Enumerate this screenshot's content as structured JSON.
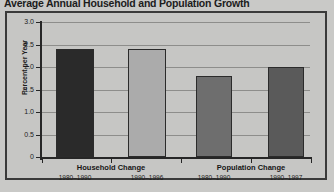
{
  "chart_data": {
    "type": "bar",
    "title": "Average Annual Household and Population Growth",
    "xlabel": "",
    "ylabel": "Percent per Year",
    "ylim": [
      0,
      3.0
    ],
    "ytick_labels": [
      "3.0",
      "2.5",
      "2.0",
      "1.5",
      "1.0",
      "0.5",
      "0"
    ],
    "ytick_values": [
      3.0,
      2.5,
      2.0,
      1.5,
      1.0,
      0.5,
      0
    ],
    "grid": "horizontal",
    "legend": "none",
    "groups": [
      {
        "name": "Household Change",
        "bars": [
          {
            "period": "1980–1990",
            "value": 2.4,
            "color": "#2a2a2a"
          },
          {
            "period": "1990–1996",
            "value": 2.4,
            "color": "#ababab"
          }
        ]
      },
      {
        "name": "Population Change",
        "bars": [
          {
            "period": "1980–1990",
            "value": 1.8,
            "color": "#6e6e6e"
          },
          {
            "period": "1990–1997",
            "value": 2.0,
            "color": "#5a5a5a"
          }
        ]
      }
    ],
    "categories": [
      "Household Change 1980–1990",
      "Household Change 1990–1996",
      "Population Change 1980–1990",
      "Population Change 1990–1997"
    ],
    "values": [
      2.4,
      2.4,
      1.8,
      2.0
    ]
  },
  "colors": {
    "page_background": "#c9c9c7",
    "plot_background": "#c6c6c4",
    "frame_border": "#3a3a3a",
    "axis": "#262626",
    "gridline": "#8d8d8b",
    "text": "#1b1b1b"
  }
}
